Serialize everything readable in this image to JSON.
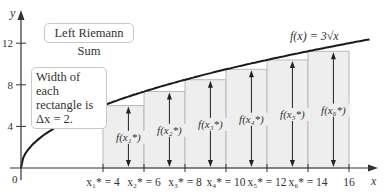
{
  "chart_data": {
    "type": "bar",
    "title": "Left Riemann Sum",
    "function_label": "f(x) = 3√x",
    "annotation": [
      "Width of each",
      "rectangle is",
      "Δx = 2."
    ],
    "xlabel": "x",
    "ylabel": "y",
    "xlim": [
      0,
      17
    ],
    "ylim": [
      0,
      14
    ],
    "x_ticks": [
      0,
      4,
      6,
      8,
      10,
      12,
      14,
      16
    ],
    "y_ticks": [
      4,
      8,
      12
    ],
    "y_tick_labels": [
      "4",
      "8",
      "12"
    ],
    "origin_label": "0",
    "categories": [
      "x₁* = 4",
      "x₂* = 6",
      "x₃* = 8",
      "x₄* = 10",
      "x₅* = 12",
      "x₆* = 14"
    ],
    "rect_left_x": [
      4,
      6,
      8,
      10,
      12,
      14
    ],
    "width": 2,
    "values": [
      6.0,
      7.35,
      8.49,
      9.49,
      10.39,
      11.22
    ],
    "bar_labels": [
      "f(x₁*)",
      "f(x₂*)",
      "f(x₃*)",
      "f(x₄*)",
      "f(x₅*)",
      "f(x₆*)"
    ],
    "end_tick_label": "16",
    "grid": false
  },
  "colors": {
    "rect_fill": "#eeeeee",
    "rect_stroke": "#b9b9b9",
    "curve": "#1a1a1a",
    "axis": "#333333"
  }
}
